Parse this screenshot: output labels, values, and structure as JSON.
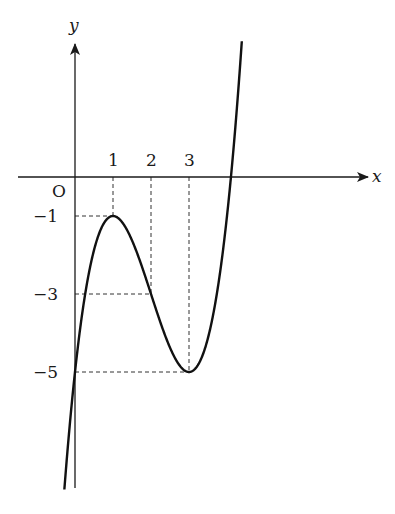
{
  "chart_data": {
    "type": "line",
    "title": "",
    "xlabel": "x",
    "ylabel": "y",
    "origin_label": "O",
    "function": "y = x^3 - 6x^2 + 9x - 5",
    "x_ticks": [
      {
        "value": 1,
        "label": "1"
      },
      {
        "value": 2,
        "label": "2"
      },
      {
        "value": 3,
        "label": "3"
      }
    ],
    "y_ticks": [
      {
        "value": -1,
        "label": "−1"
      },
      {
        "value": -3,
        "label": "−3"
      },
      {
        "value": -5,
        "label": "−5"
      }
    ],
    "key_points": [
      {
        "x": 0,
        "y": -5,
        "note": "y-intercept"
      },
      {
        "x": 1,
        "y": -1,
        "note": "local maximum"
      },
      {
        "x": 2,
        "y": -3,
        "note": "inflection point"
      },
      {
        "x": 3,
        "y": -5,
        "note": "local minimum"
      }
    ],
    "guide_lines": [
      {
        "from": [
          1,
          0
        ],
        "to": [
          1,
          -1
        ]
      },
      {
        "from": [
          0,
          -1
        ],
        "to": [
          1,
          -1
        ]
      },
      {
        "from": [
          2,
          0
        ],
        "to": [
          2,
          -3
        ]
      },
      {
        "from": [
          0,
          -3
        ],
        "to": [
          2,
          -3
        ]
      },
      {
        "from": [
          3,
          0
        ],
        "to": [
          3,
          -5
        ]
      },
      {
        "from": [
          0,
          -5
        ],
        "to": [
          3,
          -5
        ]
      }
    ],
    "xlim": [
      -1.5,
      7.5
    ],
    "ylim": [
      -8,
      4.5
    ],
    "grid": false,
    "legend": null
  }
}
